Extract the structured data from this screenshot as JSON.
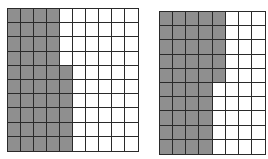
{
  "diagram": {
    "type": "hundredths-grids",
    "colors": {
      "shaded": "#8f8f8f",
      "unshaded": "#ffffff",
      "line": "#2a2a2a"
    },
    "grids": [
      {
        "name": "left-grid",
        "rows": 10,
        "cols": 10,
        "x": 7,
        "y": 8,
        "width": 132,
        "height": 144,
        "shaded_per_row": [
          4,
          4,
          4,
          4,
          5,
          5,
          5,
          5,
          5,
          5
        ],
        "shaded_total": 46
      },
      {
        "name": "right-grid",
        "rows": 10,
        "cols": 8,
        "x": 159,
        "y": 11,
        "width": 107,
        "height": 144,
        "shaded_per_row": [
          5,
          5,
          5,
          5,
          5,
          4,
          4,
          4,
          4,
          4
        ],
        "shaded_total": 45
      }
    ]
  }
}
